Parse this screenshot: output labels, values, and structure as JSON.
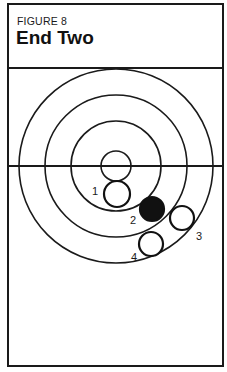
{
  "figure": {
    "label": "FIGURE 8",
    "title": "End Two"
  },
  "target": {
    "center": [
      116,
      166
    ],
    "ring_radii": [
      97,
      71,
      45,
      15
    ],
    "crosshair_y": 166,
    "color": "#1a1a1a"
  },
  "shots": [
    {
      "label": "1",
      "cx": 117,
      "cy": 194,
      "r": 13,
      "filled": false,
      "label_x": 92,
      "label_y": 195
    },
    {
      "label": "2",
      "cx": 152,
      "cy": 209,
      "r": 12,
      "filled": true,
      "label_x": 130,
      "label_y": 224
    },
    {
      "label": "3",
      "cx": 182,
      "cy": 218,
      "r": 12,
      "filled": false,
      "label_x": 196,
      "label_y": 240
    },
    {
      "label": "4",
      "cx": 151,
      "cy": 244,
      "r": 12,
      "filled": false,
      "label_x": 131,
      "label_y": 261
    }
  ]
}
